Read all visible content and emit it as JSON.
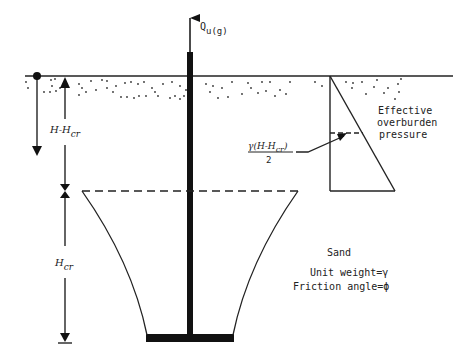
{
  "diagram": {
    "load_label": {
      "main": "Q",
      "sub": "u(g)"
    },
    "depth_label_upper": {
      "main": "H-H",
      "sub": "cr"
    },
    "depth_label_lower": {
      "main": "H",
      "sub": "cr"
    },
    "pressure_label": [
      "Effective",
      "overburden",
      "pressure"
    ],
    "average_pressure_label": {
      "numerator_main": "γ(H-H",
      "numerator_sub": "cr",
      "numerator_close": ")",
      "denominator": "2"
    },
    "soil_label": "Sand",
    "properties": [
      "Unit weight=γ",
      "Friction angle=ϕ"
    ],
    "colors": {
      "ink": "#111111",
      "background": "#ffffff"
    }
  }
}
